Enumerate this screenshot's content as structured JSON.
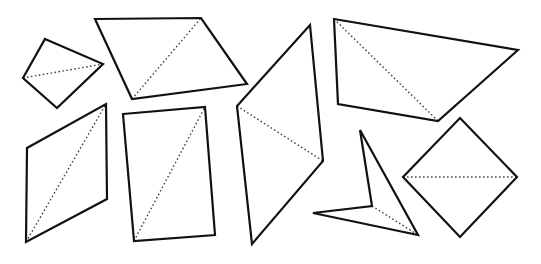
{
  "diagram": {
    "title": "",
    "canvas": {
      "width": 541,
      "height": 264,
      "background": "#ffffff"
    },
    "style": {
      "outline_color": "#111111",
      "diagonal_color": "#444444"
    },
    "shapes": [
      {
        "name": "kite-small-left",
        "points": [
          [
            45,
            39
          ],
          [
            103,
            64
          ],
          [
            57,
            108
          ],
          [
            23,
            78
          ]
        ],
        "diagonal": [
          [
            23,
            78
          ],
          [
            103,
            64
          ]
        ]
      },
      {
        "name": "parallelogram-top",
        "points": [
          [
            95,
            19
          ],
          [
            201,
            18
          ],
          [
            247,
            84
          ],
          [
            132,
            99
          ]
        ],
        "diagonal": [
          [
            132,
            99
          ],
          [
            201,
            18
          ]
        ]
      },
      {
        "name": "parallelogram-tall-center",
        "points": [
          [
            310,
            25
          ],
          [
            323,
            161
          ],
          [
            252,
            244
          ],
          [
            237,
            106
          ]
        ],
        "diagonal": [
          [
            237,
            106
          ],
          [
            323,
            161
          ]
        ]
      },
      {
        "name": "quadrilateral-top-right",
        "points": [
          [
            334,
            19
          ],
          [
            518,
            50
          ],
          [
            438,
            121
          ],
          [
            338,
            104
          ]
        ],
        "diagonal": [
          [
            334,
            19
          ],
          [
            438,
            121
          ]
        ]
      },
      {
        "name": "parallelogram-bottom-left",
        "points": [
          [
            27,
            148
          ],
          [
            106,
            104
          ],
          [
            107,
            199
          ],
          [
            26,
            242
          ]
        ],
        "diagonal": [
          [
            26,
            242
          ],
          [
            106,
            104
          ]
        ]
      },
      {
        "name": "rectangle-bottom",
        "points": [
          [
            123,
            114
          ],
          [
            205,
            107
          ],
          [
            215,
            235
          ],
          [
            134,
            241
          ]
        ],
        "diagonal": [
          [
            134,
            241
          ],
          [
            205,
            107
          ]
        ]
      },
      {
        "name": "concave-dart",
        "points": [
          [
            360,
            130
          ],
          [
            418,
            235
          ],
          [
            313,
            213
          ],
          [
            372,
            206
          ]
        ],
        "diagonal": [
          [
            372,
            206
          ],
          [
            418,
            235
          ]
        ]
      },
      {
        "name": "square-diamond-right",
        "points": [
          [
            460,
            118
          ],
          [
            517,
            177
          ],
          [
            460,
            237
          ],
          [
            403,
            177
          ]
        ],
        "diagonal": [
          [
            403,
            177
          ],
          [
            517,
            177
          ]
        ]
      }
    ]
  }
}
